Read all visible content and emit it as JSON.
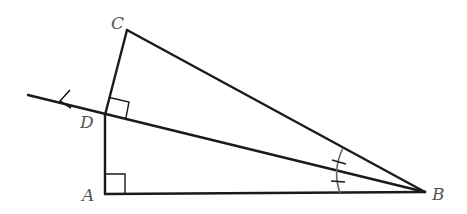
{
  "figure": {
    "type": "geometry",
    "colors": {
      "stroke": "#1a1a1a",
      "label": "#555555",
      "arc": "#666666",
      "background": "#ffffff"
    },
    "points": {
      "A": {
        "label": "A",
        "x": 105,
        "y": 194
      },
      "B": {
        "label": "B",
        "x": 425,
        "y": 192
      },
      "C": {
        "label": "C",
        "x": 127,
        "y": 30
      },
      "D": {
        "label": "D",
        "x": 105,
        "y": 115
      }
    },
    "segments": [
      {
        "from": "A",
        "to": "B"
      },
      {
        "from": "B",
        "to": "C"
      },
      {
        "from": "C",
        "to": "D"
      },
      {
        "from": "D",
        "to": "A"
      }
    ],
    "ray": {
      "from": "B",
      "through": "D",
      "extends_to": {
        "x": 28,
        "y": 95
      },
      "arrow": true
    },
    "right_angles": [
      {
        "at": "A",
        "between": [
          "AD",
          "AB"
        ]
      },
      {
        "at": "D",
        "between": [
          "DC",
          "DB"
        ]
      }
    ],
    "angle_marks": [
      {
        "at": "B",
        "type": "congruent-tick",
        "count": 1,
        "between": [
          "BC",
          "BD"
        ]
      },
      {
        "at": "B",
        "type": "congruent-tick",
        "count": 1,
        "between": [
          "BD",
          "BA"
        ]
      }
    ]
  },
  "labels": {
    "A": "A",
    "B": "B",
    "C": "C",
    "D": "D"
  }
}
